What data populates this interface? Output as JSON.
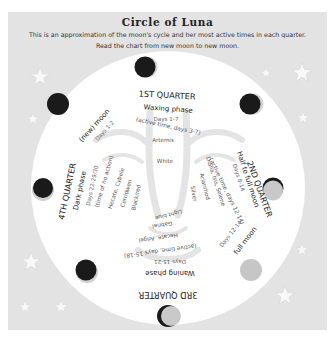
{
  "header": {
    "title": "Circle of Luna",
    "subtitle_line1": "This is an approximation of the moon's cycle and her most active times in each quarter.",
    "subtitle_line2": "Read the chart from new moon to new moon."
  },
  "colors": {
    "panel_bg": "#e3e3e3",
    "circle_bg": "#ffffff",
    "moon_dark": "#1a1a1a",
    "moon_light": "#c9c9c9",
    "face_shade": "#e6e6e6",
    "star": "#f7f7f7"
  },
  "quarters": [
    {
      "name": "1ST QUARTER",
      "phase": "Waxing phase",
      "days": "Days 1-7",
      "active": "(active time, days 3-7)",
      "deities": [
        "Artemis",
        "White"
      ]
    },
    {
      "name": "2ND QUARTER",
      "phase": "Half to full moon",
      "days": "Days 8-14",
      "active": "(active time, days 12-14)",
      "deities": [
        "Diana, Isis, Selene",
        "Arianrhod",
        "Silver"
      ]
    },
    {
      "name": "3RD QUARTER",
      "phase": "Waning phase",
      "days": "Days 15-21",
      "active": "(active time, days 15-18)",
      "deities": [
        "Hecate, Angel",
        "Gabriel",
        "Light blue"
      ]
    },
    {
      "name": "4TH QUARTER",
      "phase": "Dark phase",
      "days": "Days 22-29/30",
      "active": "(time of no action)",
      "deities": [
        "Hecate, Cybele",
        "Cerridwen",
        "Black/red"
      ]
    }
  ],
  "markers": {
    "new_moon": {
      "label": "(new) moon",
      "days": "Days 1-2"
    },
    "full_moon": {
      "label": "full moon",
      "days": "Days 12-14"
    }
  },
  "moons": [
    {
      "position": "top",
      "icon": "waxing-crescent-moon-icon"
    },
    {
      "position": "upper-right",
      "icon": "waxing-crescent-moon-icon"
    },
    {
      "position": "right",
      "icon": "first-quarter-moon-icon"
    },
    {
      "position": "lower-right",
      "icon": "full-moon-icon"
    },
    {
      "position": "bottom",
      "icon": "waning-moon-icon"
    },
    {
      "position": "lower-left",
      "icon": "waning-crescent-moon-icon"
    },
    {
      "position": "left",
      "icon": "dark-moon-icon"
    },
    {
      "position": "upper-left",
      "icon": "new-moon-icon"
    }
  ]
}
